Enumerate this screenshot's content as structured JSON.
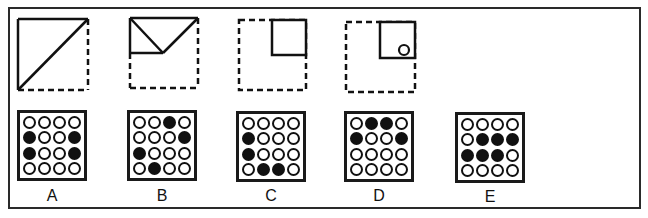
{
  "question_figures": [
    {
      "id": "fig1",
      "description": "square with dashed right and bottom edges; solid top, left, and diagonal from bottom-left to top-right"
    },
    {
      "id": "fig2",
      "description": "square with solid top edge, solid upper half of left edge, solid half of mid-horizontal, V-shaped diagonals meeting at middle; rest dashed"
    },
    {
      "id": "fig3",
      "description": "dashed square with solid top-right quarter square"
    },
    {
      "id": "fig4",
      "description": "dashed square with solid top-right quarter square containing a small circle in its bottom-right"
    }
  ],
  "options": [
    {
      "label": "A",
      "grid": [
        [
          0,
          0,
          0,
          0
        ],
        [
          1,
          0,
          0,
          1
        ],
        [
          1,
          0,
          0,
          1
        ],
        [
          0,
          0,
          0,
          0
        ]
      ]
    },
    {
      "label": "B",
      "grid": [
        [
          0,
          0,
          1,
          0
        ],
        [
          0,
          0,
          0,
          1
        ],
        [
          1,
          0,
          0,
          0
        ],
        [
          0,
          1,
          0,
          0
        ]
      ]
    },
    {
      "label": "C",
      "grid": [
        [
          0,
          0,
          0,
          0
        ],
        [
          1,
          0,
          0,
          0
        ],
        [
          1,
          0,
          0,
          0
        ],
        [
          0,
          1,
          1,
          0
        ]
      ]
    },
    {
      "label": "D",
      "grid": [
        [
          0,
          1,
          1,
          0
        ],
        [
          1,
          0,
          0,
          1
        ],
        [
          0,
          0,
          0,
          0
        ],
        [
          0,
          0,
          0,
          0
        ]
      ]
    },
    {
      "label": "E",
      "grid": [
        [
          0,
          0,
          0,
          0
        ],
        [
          0,
          1,
          1,
          1
        ],
        [
          1,
          1,
          1,
          0
        ],
        [
          0,
          0,
          0,
          0
        ]
      ]
    }
  ],
  "colors": {
    "ink": "#111111",
    "background": "#ffffff"
  }
}
